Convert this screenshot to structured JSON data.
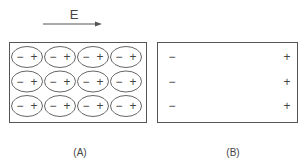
{
  "field": {
    "label": "E",
    "direction": "right"
  },
  "panels": [
    {
      "caption": "(A)",
      "description": "dielectric with polarized molecules (dipoles)",
      "rows": 3,
      "cols": 4,
      "dipole": {
        "negative": "−",
        "positive": "+"
      }
    },
    {
      "caption": "(B)",
      "description": "net surface charges",
      "left_charges": [
        "−",
        "−",
        "−"
      ],
      "right_charges": [
        "+",
        "+",
        "+"
      ]
    }
  ],
  "colors": {
    "stroke": "#555555",
    "text": "#444444",
    "background": "#ffffff"
  }
}
